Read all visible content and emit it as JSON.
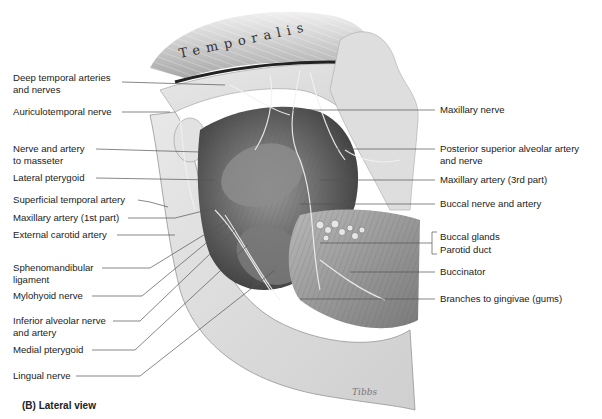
{
  "figure": {
    "caption": "(B) Lateral view",
    "muscle_title": "Temporalis",
    "signature": "Tibbs",
    "colors": {
      "leader": "#555555",
      "bone": "#d9d9d9",
      "muscle": "#8a8a8a",
      "shadow": "#3a3a3a",
      "background": "#ffffff"
    }
  },
  "labels": {
    "left": [
      {
        "text": "Deep temporal arteries\nand nerves",
        "x": 13,
        "y": 78
      },
      {
        "text": "Auriculotemporal nerve",
        "x": 13,
        "y": 108
      },
      {
        "text": "Nerve and artery\nto masseter",
        "x": 13,
        "y": 145
      },
      {
        "text": "Lateral pterygoid",
        "x": 13,
        "y": 174
      },
      {
        "text": "Superficial temporal artery",
        "x": 13,
        "y": 196
      },
      {
        "text": "Maxillary artery (1st part)",
        "x": 13,
        "y": 214
      },
      {
        "text": "External carotid artery",
        "x": 13,
        "y": 231
      },
      {
        "text": "Sphenomandibular\nligament",
        "x": 13,
        "y": 264
      },
      {
        "text": "Mylohyoid nerve",
        "x": 13,
        "y": 292
      },
      {
        "text": "Inferior alveolar nerve\nand artery",
        "x": 13,
        "y": 317
      },
      {
        "text": "Medial pterygoid",
        "x": 13,
        "y": 346
      },
      {
        "text": "Lingual nerve",
        "x": 13,
        "y": 372
      }
    ],
    "right": [
      {
        "text": "Maxillary nerve",
        "x": 440,
        "y": 104
      },
      {
        "text": "Posterior superior alveolar artery\nand nerve",
        "x": 440,
        "y": 145
      },
      {
        "text": "Maxillary artery (3rd part)",
        "x": 440,
        "y": 176
      },
      {
        "text": "Buccal nerve and artery",
        "x": 440,
        "y": 200
      },
      {
        "text": "Buccal glands",
        "x": 440,
        "y": 231
      },
      {
        "text": "Parotid duct",
        "x": 440,
        "y": 244
      },
      {
        "text": "Buccinator",
        "x": 440,
        "y": 268
      },
      {
        "text": "Branches to gingivae (gums)",
        "x": 440,
        "y": 295
      }
    ]
  }
}
